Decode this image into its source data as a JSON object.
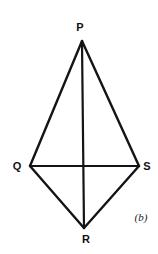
{
  "figure": {
    "caption": "(b)",
    "background_color": "#ffffff",
    "line_color": "#141414",
    "label_color": "#111111",
    "width": 158,
    "height": 254,
    "vertices": [
      {
        "name": "P",
        "label": "P",
        "x": 82,
        "y": 41,
        "label_x": 80,
        "label_y": 27
      },
      {
        "name": "Q",
        "label": "Q",
        "x": 30,
        "y": 166,
        "label_x": 17,
        "label_y": 166
      },
      {
        "name": "S",
        "label": "S",
        "x": 139,
        "y": 166,
        "label_x": 147,
        "label_y": 166
      },
      {
        "name": "R",
        "label": "R",
        "x": 84,
        "y": 228,
        "label_x": 86,
        "label_y": 239
      }
    ],
    "edges": [
      {
        "name": "edge-PQ",
        "from": "P",
        "to": "Q",
        "width": 2.4
      },
      {
        "name": "edge-PS",
        "from": "P",
        "to": "S",
        "width": 2.4
      },
      {
        "name": "edge-QR",
        "from": "Q",
        "to": "R",
        "width": 2.4
      },
      {
        "name": "edge-SR",
        "from": "S",
        "to": "R",
        "width": 2.4
      }
    ],
    "diagonals": [
      {
        "name": "diagonal-PR",
        "from": "P",
        "to": "R",
        "width": 2.2
      },
      {
        "name": "diagonal-QS",
        "from": "Q",
        "to": "S",
        "width": 2.2
      }
    ],
    "caption_x": 141,
    "caption_y": 217
  }
}
